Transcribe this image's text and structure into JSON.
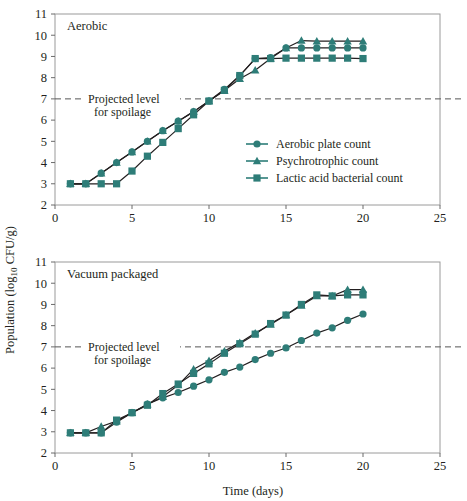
{
  "figure": {
    "y_axis_label_main": "Population (log",
    "y_axis_label_sub": "10",
    "y_axis_label_tail": " CFU/g)",
    "x_axis_label": "Time (days)",
    "accent_color": "#2e7d78",
    "line_color": "#231f20",
    "spoilage_line_color": "#555555"
  },
  "legend": {
    "position": "inside-top-panel-lower-right",
    "items": [
      {
        "label": "Aerobic plate count",
        "marker": "circle",
        "color": "#2e7d78"
      },
      {
        "label": "Psychrotrophic count",
        "marker": "triangle",
        "color": "#2e7d78"
      },
      {
        "label": "Lactic acid bacterial count",
        "marker": "square",
        "color": "#2e7d78"
      }
    ]
  },
  "annotations": {
    "spoilage_line1": "Projected level",
    "spoilage_line2": "for spoilage",
    "spoilage_value": 7
  },
  "chart_data": [
    {
      "type": "line",
      "title": "Aerobic",
      "panel": "top",
      "xlabel": "Time (days)",
      "ylabel": "Population (log10 CFU/g)",
      "xlim": [
        0,
        25
      ],
      "ylim": [
        2,
        11
      ],
      "xticks": [
        0,
        5,
        10,
        15,
        20,
        25
      ],
      "yticks": [
        2,
        3,
        4,
        5,
        6,
        7,
        8,
        9,
        10,
        11
      ],
      "grid": false,
      "hline": {
        "y": 7,
        "style": "dashed",
        "label": "Projected level for spoilage"
      },
      "series": [
        {
          "name": "Aerobic plate count",
          "marker": "circle",
          "x": [
            1,
            2,
            3,
            4,
            5,
            6,
            7,
            8,
            9,
            10,
            11,
            12,
            13,
            14,
            15,
            16,
            17,
            18,
            19,
            20
          ],
          "y": [
            3.0,
            3.0,
            3.5,
            4.0,
            4.5,
            5.0,
            5.5,
            5.95,
            6.4,
            6.9,
            7.45,
            8.1,
            8.9,
            8.95,
            9.4,
            9.4,
            9.4,
            9.4,
            9.4,
            9.4
          ]
        },
        {
          "name": "Psychrotrophic count",
          "marker": "triangle",
          "x": [
            1,
            2,
            3,
            4,
            5,
            6,
            7,
            8,
            9,
            10,
            11,
            12,
            13,
            14,
            15,
            16,
            17,
            18,
            19,
            20
          ],
          "y": [
            3.0,
            3.0,
            3.5,
            4.0,
            4.5,
            5.0,
            5.5,
            5.95,
            6.4,
            6.9,
            7.4,
            7.95,
            8.35,
            8.9,
            9.4,
            9.75,
            9.72,
            9.72,
            9.72,
            9.72
          ]
        },
        {
          "name": "Lactic acid bacterial count",
          "marker": "square",
          "x": [
            1,
            2,
            3,
            4,
            5,
            6,
            7,
            8,
            9,
            10,
            11,
            12,
            13,
            14,
            15,
            16,
            17,
            18,
            19,
            20
          ],
          "y": [
            3.0,
            3.0,
            3.0,
            3.0,
            3.6,
            4.3,
            4.95,
            5.6,
            6.25,
            6.9,
            7.4,
            8.1,
            8.9,
            8.9,
            8.92,
            8.92,
            8.92,
            8.92,
            8.92,
            8.9
          ]
        }
      ]
    },
    {
      "type": "line",
      "title": "Vacuum packaged",
      "panel": "bottom",
      "xlabel": "Time (days)",
      "ylabel": "Population (log10 CFU/g)",
      "xlim": [
        0,
        25
      ],
      "ylim": [
        2,
        11
      ],
      "xticks": [
        0,
        5,
        10,
        15,
        20,
        25
      ],
      "yticks": [
        2,
        3,
        4,
        5,
        6,
        7,
        8,
        9,
        10,
        11
      ],
      "grid": false,
      "hline": {
        "y": 7,
        "style": "dashed",
        "label": "Projected level for spoilage"
      },
      "series": [
        {
          "name": "Aerobic plate count",
          "marker": "circle",
          "x": [
            1,
            2,
            3,
            4,
            5,
            6,
            7,
            8,
            9,
            10,
            11,
            12,
            13,
            14,
            15,
            16,
            17,
            18,
            19,
            20
          ],
          "y": [
            2.95,
            2.95,
            2.95,
            3.45,
            3.9,
            4.3,
            4.6,
            4.85,
            5.15,
            5.45,
            5.8,
            6.05,
            6.4,
            6.7,
            6.95,
            7.3,
            7.65,
            7.9,
            8.25,
            8.55
          ]
        },
        {
          "name": "Psychrotrophic count",
          "marker": "triangle",
          "x": [
            1,
            2,
            3,
            4,
            5,
            6,
            7,
            8,
            9,
            10,
            11,
            12,
            13,
            14,
            15,
            16,
            17,
            18,
            19,
            20
          ],
          "y": [
            2.95,
            2.95,
            3.25,
            3.5,
            3.9,
            4.3,
            4.65,
            5.2,
            5.95,
            6.35,
            6.8,
            7.2,
            7.65,
            8.05,
            8.5,
            8.95,
            9.4,
            9.4,
            9.7,
            9.7
          ]
        },
        {
          "name": "Lactic acid bacterial count",
          "marker": "square",
          "x": [
            1,
            2,
            3,
            4,
            5,
            6,
            7,
            8,
            9,
            10,
            11,
            12,
            13,
            14,
            15,
            16,
            17,
            18,
            19,
            20
          ],
          "y": [
            2.95,
            2.95,
            2.95,
            3.55,
            3.9,
            4.25,
            4.8,
            5.25,
            5.75,
            6.2,
            6.7,
            7.15,
            7.6,
            8.1,
            8.5,
            9.0,
            9.45,
            9.4,
            9.45,
            9.45
          ]
        }
      ]
    }
  ]
}
